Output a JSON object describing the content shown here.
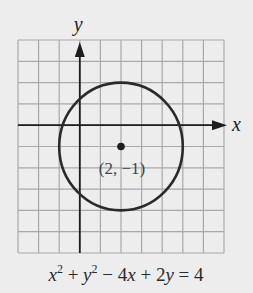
{
  "chart_data": {
    "type": "line",
    "title": "",
    "xlabel": "x",
    "ylabel": "y",
    "xlim": [
      -3,
      7
    ],
    "ylim": [
      -6,
      4
    ],
    "grid": true,
    "circle": {
      "center": [
        2,
        -1
      ],
      "radius": 3
    },
    "point": {
      "x": 2,
      "y": -1,
      "label": "(2, −1)"
    },
    "equation": {
      "parts": [
        "x",
        "2",
        " + ",
        "y",
        "2",
        " − 4",
        "x",
        " + 2",
        "y",
        " = 4"
      ]
    }
  },
  "labels": {
    "x_axis": "x",
    "y_axis": "y"
  }
}
